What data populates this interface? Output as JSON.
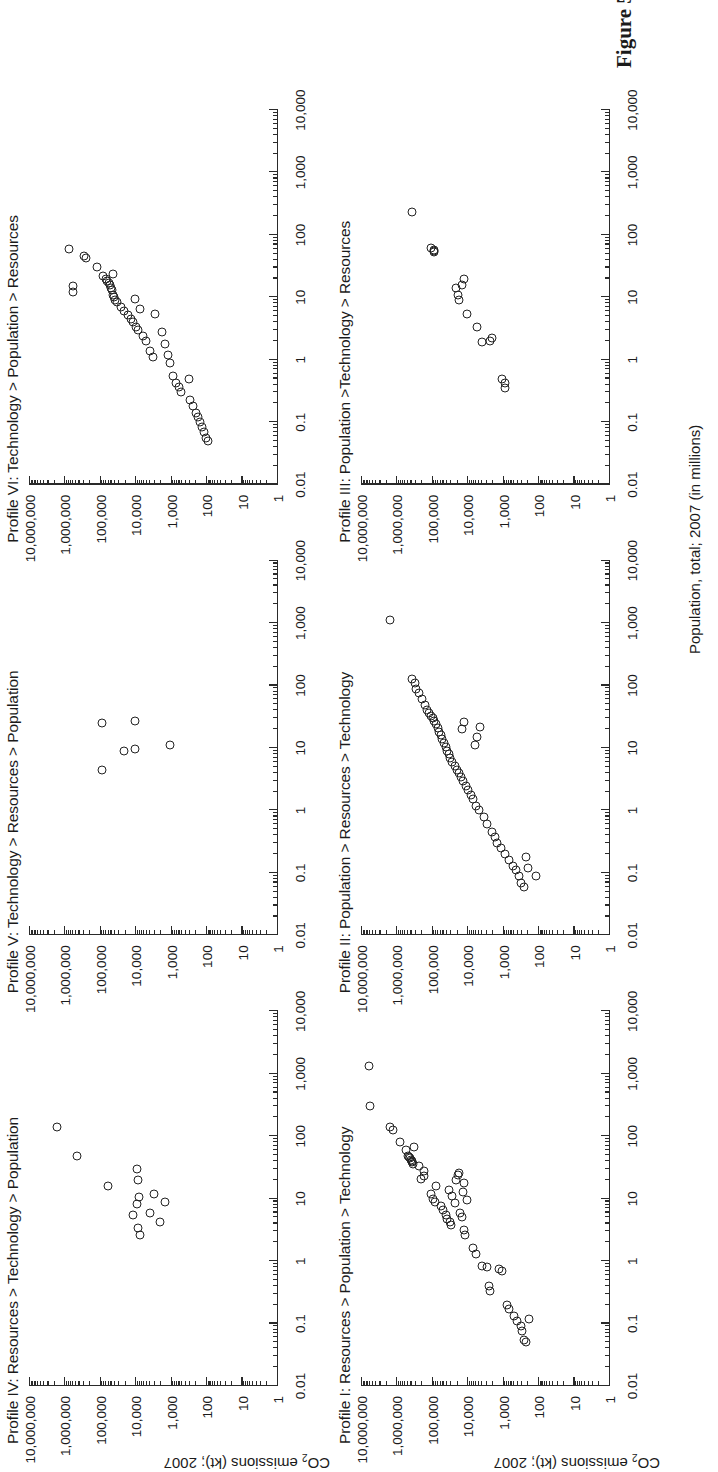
{
  "figure": {
    "caption": "Figure 5.4b",
    "x_axis_label_prefix": "Population, total; 2007 (in millions)",
    "y_axis_label_part1": "CO",
    "y_axis_label_sub": "2",
    "y_axis_label_part2": " emissions (kt); 2007"
  },
  "chart_data": {
    "type": "scatter",
    "title": "Figure 5.4b",
    "xlabel": "Population, total; 2007 (in millions)",
    "ylabel": "CO2 emissions (kt); 2007",
    "xscale": "log",
    "yscale": "log",
    "xlim": [
      0.01,
      10000
    ],
    "ylim": [
      1,
      10000000
    ],
    "grid": false,
    "legend": "none",
    "xticks": [
      "0.01",
      "0.1",
      "1",
      "10",
      "100",
      "1,000",
      "10,000"
    ],
    "yticks": [
      "1",
      "10",
      "100",
      "1,000",
      "10,000",
      "100,000",
      "1,000,000",
      "10,000,000"
    ],
    "marker": "open-circle",
    "panels": [
      {
        "id": "profile-4",
        "row": 0,
        "col": 0,
        "title": "Profile IV: Resources > Technology > Population",
        "points": [
          {
            "x": 143.0,
            "y": 1700000
          },
          {
            "x": 49.0,
            "y": 480000
          },
          {
            "x": 16.0,
            "y": 62000
          },
          {
            "x": 5.4,
            "y": 12000
          },
          {
            "x": 3.4,
            "y": 9000
          },
          {
            "x": 2.6,
            "y": 8000
          },
          {
            "x": 8.2,
            "y": 9500
          },
          {
            "x": 10.5,
            "y": 8500
          },
          {
            "x": 20.0,
            "y": 9000
          },
          {
            "x": 6.0,
            "y": 4200
          },
          {
            "x": 12.0,
            "y": 3200
          },
          {
            "x": 4.3,
            "y": 2100
          },
          {
            "x": 9.0,
            "y": 1500
          },
          {
            "x": 30.0,
            "y": 9500
          }
        ]
      },
      {
        "id": "profile-5",
        "row": 0,
        "col": 1,
        "title": "Profile V: Technology > Resources > Population",
        "points": [
          {
            "x": 4.5,
            "y": 95000
          },
          {
            "x": 25.0,
            "y": 95000
          },
          {
            "x": 9.0,
            "y": 22000
          },
          {
            "x": 9.5,
            "y": 11000
          },
          {
            "x": 27.0,
            "y": 11000
          },
          {
            "x": 11.0,
            "y": 1100
          }
        ]
      },
      {
        "id": "profile-6",
        "row": 0,
        "col": 2,
        "title": "Profile VI: Technology > Population > Resources",
        "points": [
          {
            "x": 60.0,
            "y": 800000
          },
          {
            "x": 12.0,
            "y": 620000
          },
          {
            "x": 15.0,
            "y": 600000
          },
          {
            "x": 46.0,
            "y": 290000
          },
          {
            "x": 42.0,
            "y": 260000
          },
          {
            "x": 31.0,
            "y": 130000
          },
          {
            "x": 22.0,
            "y": 85000
          },
          {
            "x": 20.0,
            "y": 72000
          },
          {
            "x": 18.0,
            "y": 66000
          },
          {
            "x": 17.0,
            "y": 60000
          },
          {
            "x": 16.0,
            "y": 56000
          },
          {
            "x": 14.0,
            "y": 52000
          },
          {
            "x": 13.0,
            "y": 48000
          },
          {
            "x": 11.0,
            "y": 45000
          },
          {
            "x": 10.0,
            "y": 42000
          },
          {
            "x": 9.0,
            "y": 40000
          },
          {
            "x": 8.5,
            "y": 36000
          },
          {
            "x": 24.0,
            "y": 45000
          },
          {
            "x": 7.0,
            "y": 27000
          },
          {
            "x": 6.0,
            "y": 22000
          },
          {
            "x": 5.2,
            "y": 17000
          },
          {
            "x": 4.5,
            "y": 14000
          },
          {
            "x": 4.0,
            "y": 12000
          },
          {
            "x": 3.4,
            "y": 10500
          },
          {
            "x": 3.0,
            "y": 9000
          },
          {
            "x": 9.5,
            "y": 11000
          },
          {
            "x": 6.5,
            "y": 8000
          },
          {
            "x": 2.4,
            "y": 6500
          },
          {
            "x": 2.0,
            "y": 5200
          },
          {
            "x": 1.4,
            "y": 4100
          },
          {
            "x": 1.1,
            "y": 3400
          },
          {
            "x": 5.5,
            "y": 3000
          },
          {
            "x": 2.8,
            "y": 1900
          },
          {
            "x": 1.8,
            "y": 1500
          },
          {
            "x": 1.2,
            "y": 1250
          },
          {
            "x": 0.9,
            "y": 1100
          },
          {
            "x": 0.55,
            "y": 900
          },
          {
            "x": 0.42,
            "y": 760
          },
          {
            "x": 0.36,
            "y": 640
          },
          {
            "x": 0.3,
            "y": 560
          },
          {
            "x": 0.5,
            "y": 330
          },
          {
            "x": 0.23,
            "y": 300
          },
          {
            "x": 0.18,
            "y": 250
          },
          {
            "x": 0.14,
            "y": 210
          },
          {
            "x": 0.12,
            "y": 185
          },
          {
            "x": 0.1,
            "y": 160
          },
          {
            "x": 0.085,
            "y": 140
          },
          {
            "x": 0.07,
            "y": 120
          },
          {
            "x": 0.055,
            "y": 105
          },
          {
            "x": 0.05,
            "y": 95
          }
        ]
      },
      {
        "id": "profile-1",
        "row": 1,
        "col": 0,
        "title": "Profile I: Resources > Population > Technology",
        "points": [
          {
            "x": 1320.0,
            "y": 6500000
          },
          {
            "x": 302.0,
            "y": 5800000
          },
          {
            "x": 142.0,
            "y": 1600000
          },
          {
            "x": 128.0,
            "y": 1300000
          },
          {
            "x": 82.0,
            "y": 850000
          },
          {
            "x": 61.0,
            "y": 560000
          },
          {
            "x": 48.0,
            "y": 510000
          },
          {
            "x": 46.0,
            "y": 460000
          },
          {
            "x": 44.0,
            "y": 440000
          },
          {
            "x": 42.0,
            "y": 420000
          },
          {
            "x": 40.0,
            "y": 400000
          },
          {
            "x": 38.0,
            "y": 380000
          },
          {
            "x": 36.0,
            "y": 360000
          },
          {
            "x": 66.0,
            "y": 340000
          },
          {
            "x": 33.0,
            "y": 250000
          },
          {
            "x": 21.0,
            "y": 210000
          },
          {
            "x": 23.0,
            "y": 180000
          },
          {
            "x": 28.0,
            "y": 175000
          },
          {
            "x": 12.0,
            "y": 110000
          },
          {
            "x": 10.0,
            "y": 98000
          },
          {
            "x": 9.0,
            "y": 88000
          },
          {
            "x": 16.0,
            "y": 84000
          },
          {
            "x": 7.5,
            "y": 60000
          },
          {
            "x": 6.5,
            "y": 52000
          },
          {
            "x": 5.5,
            "y": 44000
          },
          {
            "x": 4.8,
            "y": 40000
          },
          {
            "x": 4.2,
            "y": 33000
          },
          {
            "x": 3.8,
            "y": 31000
          },
          {
            "x": 14.0,
            "y": 36000
          },
          {
            "x": 11.0,
            "y": 28000
          },
          {
            "x": 8.5,
            "y": 24000
          },
          {
            "x": 20.0,
            "y": 22000
          },
          {
            "x": 24.0,
            "y": 20000
          },
          {
            "x": 26.0,
            "y": 18000
          },
          {
            "x": 6.0,
            "y": 17000
          },
          {
            "x": 5.0,
            "y": 15000
          },
          {
            "x": 3.2,
            "y": 13500
          },
          {
            "x": 2.6,
            "y": 12000
          },
          {
            "x": 13.0,
            "y": 14000
          },
          {
            "x": 18.0,
            "y": 13000
          },
          {
            "x": 9.5,
            "y": 11000
          },
          {
            "x": 1.6,
            "y": 7500
          },
          {
            "x": 1.3,
            "y": 6000
          },
          {
            "x": 0.85,
            "y": 4000
          },
          {
            "x": 0.8,
            "y": 3000
          },
          {
            "x": 0.4,
            "y": 2600
          },
          {
            "x": 0.33,
            "y": 2400
          },
          {
            "x": 0.75,
            "y": 1400
          },
          {
            "x": 0.7,
            "y": 1100
          },
          {
            "x": 0.2,
            "y": 800
          },
          {
            "x": 0.17,
            "y": 700
          },
          {
            "x": 0.13,
            "y": 500
          },
          {
            "x": 0.11,
            "y": 420
          },
          {
            "x": 0.09,
            "y": 330
          },
          {
            "x": 0.075,
            "y": 300
          },
          {
            "x": 0.055,
            "y": 260
          },
          {
            "x": 0.05,
            "y": 230
          },
          {
            "x": 0.12,
            "y": 190
          }
        ]
      },
      {
        "id": "profile-2",
        "row": 1,
        "col": 1,
        "title": "Profile II: Population > Resources > Technology",
        "points": [
          {
            "x": 1140.0,
            "y": 1600000
          },
          {
            "x": 128.0,
            "y": 380000
          },
          {
            "x": 110.0,
            "y": 330000
          },
          {
            "x": 88.0,
            "y": 290000
          },
          {
            "x": 75.0,
            "y": 250000
          },
          {
            "x": 62.0,
            "y": 200000
          },
          {
            "x": 48.0,
            "y": 170000
          },
          {
            "x": 40.0,
            "y": 150000
          },
          {
            "x": 36.0,
            "y": 130000
          },
          {
            "x": 33.0,
            "y": 115000
          },
          {
            "x": 30.0,
            "y": 100000
          },
          {
            "x": 27.0,
            "y": 90000
          },
          {
            "x": 24.0,
            "y": 82000
          },
          {
            "x": 21.0,
            "y": 74000
          },
          {
            "x": 18.0,
            "y": 66000
          },
          {
            "x": 16.0,
            "y": 60000
          },
          {
            "x": 14.0,
            "y": 54000
          },
          {
            "x": 12.0,
            "y": 48000
          },
          {
            "x": 10.5,
            "y": 44000
          },
          {
            "x": 9.0,
            "y": 40000
          },
          {
            "x": 8.0,
            "y": 36000
          },
          {
            "x": 7.0,
            "y": 32000
          },
          {
            "x": 6.0,
            "y": 28000
          },
          {
            "x": 5.2,
            "y": 24000
          },
          {
            "x": 4.5,
            "y": 21000
          },
          {
            "x": 4.0,
            "y": 18000
          },
          {
            "x": 3.4,
            "y": 16000
          },
          {
            "x": 3.0,
            "y": 14000
          },
          {
            "x": 20.0,
            "y": 15000
          },
          {
            "x": 26.0,
            "y": 13000
          },
          {
            "x": 2.5,
            "y": 11500
          },
          {
            "x": 2.1,
            "y": 10000
          },
          {
            "x": 1.8,
            "y": 8500
          },
          {
            "x": 1.5,
            "y": 7200
          },
          {
            "x": 1.2,
            "y": 6000
          },
          {
            "x": 1.0,
            "y": 5000
          },
          {
            "x": 11.0,
            "y": 6500
          },
          {
            "x": 15.0,
            "y": 5500
          },
          {
            "x": 22.0,
            "y": 4800
          },
          {
            "x": 0.8,
            "y": 3600
          },
          {
            "x": 0.6,
            "y": 2900
          },
          {
            "x": 0.45,
            "y": 2200
          },
          {
            "x": 0.38,
            "y": 1800
          },
          {
            "x": 0.3,
            "y": 1500
          },
          {
            "x": 0.25,
            "y": 1200
          },
          {
            "x": 0.2,
            "y": 900
          },
          {
            "x": 0.16,
            "y": 700
          },
          {
            "x": 0.13,
            "y": 560
          },
          {
            "x": 0.11,
            "y": 460
          },
          {
            "x": 0.09,
            "y": 380
          },
          {
            "x": 0.07,
            "y": 320
          },
          {
            "x": 0.06,
            "y": 270
          },
          {
            "x": 0.18,
            "y": 230
          },
          {
            "x": 0.12,
            "y": 200
          },
          {
            "x": 0.09,
            "y": 120
          }
        ]
      },
      {
        "id": "profile-3",
        "row": 1,
        "col": 2,
        "title": "Profile III: Population >Technology > Resources",
        "points": [
          {
            "x": 230.0,
            "y": 380000
          },
          {
            "x": 62.0,
            "y": 110000
          },
          {
            "x": 58.0,
            "y": 95000
          },
          {
            "x": 54.0,
            "y": 92000
          },
          {
            "x": 56.0,
            "y": 90000
          },
          {
            "x": 14.0,
            "y": 22000
          },
          {
            "x": 11.0,
            "y": 20000
          },
          {
            "x": 9.0,
            "y": 18000
          },
          {
            "x": 16.0,
            "y": 15000
          },
          {
            "x": 20.0,
            "y": 13000
          },
          {
            "x": 5.5,
            "y": 11000
          },
          {
            "x": 3.4,
            "y": 5500
          },
          {
            "x": 1.9,
            "y": 4000
          },
          {
            "x": 2.0,
            "y": 2500
          },
          {
            "x": 2.2,
            "y": 2200
          },
          {
            "x": 0.5,
            "y": 1100
          },
          {
            "x": 0.42,
            "y": 950
          },
          {
            "x": 0.35,
            "y": 900
          }
        ]
      }
    ]
  }
}
